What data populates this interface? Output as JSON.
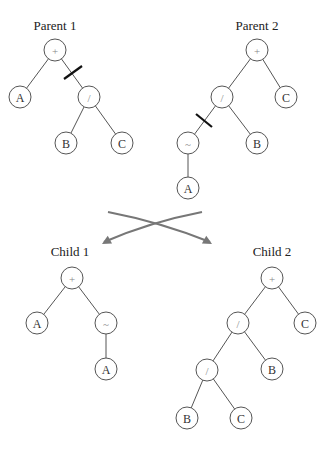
{
  "colors": {
    "edge": "#555555",
    "cut": "#111111",
    "arrow": "#777777"
  },
  "trees": [
    {
      "label": "Parent 1",
      "label_pos": [
        55,
        30
      ],
      "nodes": [
        {
          "id": "p1-plus",
          "text": "+",
          "op": true,
          "x": 55,
          "y": 50
        },
        {
          "id": "p1-a",
          "text": "A",
          "op": false,
          "x": 20,
          "y": 97
        },
        {
          "id": "p1-div",
          "text": "/",
          "op": true,
          "x": 89,
          "y": 97
        },
        {
          "id": "p1-b",
          "text": "B",
          "op": false,
          "x": 66,
          "y": 143
        },
        {
          "id": "p1-c",
          "text": "C",
          "op": false,
          "x": 122,
          "y": 143
        }
      ],
      "edges": [
        [
          "p1-plus",
          "p1-a"
        ],
        [
          "p1-plus",
          "p1-div"
        ],
        [
          "p1-div",
          "p1-b"
        ],
        [
          "p1-div",
          "p1-c"
        ]
      ],
      "cut": {
        "x1": 64,
        "y1": 79,
        "x2": 82,
        "y2": 66
      }
    },
    {
      "label": "Parent 2",
      "label_pos": [
        257,
        30
      ],
      "nodes": [
        {
          "id": "p2-plus",
          "text": "+",
          "op": true,
          "x": 257,
          "y": 50
        },
        {
          "id": "p2-div",
          "text": "/",
          "op": true,
          "x": 222,
          "y": 97
        },
        {
          "id": "p2-c",
          "text": "C",
          "op": false,
          "x": 286,
          "y": 97
        },
        {
          "id": "p2-tilde",
          "text": "~",
          "op": true,
          "x": 188,
          "y": 143
        },
        {
          "id": "p2-b",
          "text": "B",
          "op": false,
          "x": 257,
          "y": 143
        },
        {
          "id": "p2-a",
          "text": "A",
          "op": false,
          "x": 188,
          "y": 188
        }
      ],
      "edges": [
        [
          "p2-plus",
          "p2-div"
        ],
        [
          "p2-plus",
          "p2-c"
        ],
        [
          "p2-div",
          "p2-tilde"
        ],
        [
          "p2-div",
          "p2-b"
        ],
        [
          "p2-tilde",
          "p2-a"
        ]
      ],
      "cut": {
        "x1": 196,
        "y1": 114,
        "x2": 212,
        "y2": 127
      }
    },
    {
      "label": "Child 1",
      "label_pos": [
        70,
        256
      ],
      "nodes": [
        {
          "id": "c1-plus",
          "text": "+",
          "op": true,
          "x": 72,
          "y": 278
        },
        {
          "id": "c1-a",
          "text": "A",
          "op": false,
          "x": 37,
          "y": 323
        },
        {
          "id": "c1-tilde",
          "text": "~",
          "op": true,
          "x": 106,
          "y": 323
        },
        {
          "id": "c1-a2",
          "text": "A",
          "op": false,
          "x": 106,
          "y": 369
        }
      ],
      "edges": [
        [
          "c1-plus",
          "c1-a"
        ],
        [
          "c1-plus",
          "c1-tilde"
        ],
        [
          "c1-tilde",
          "c1-a2"
        ]
      ],
      "cut": null
    },
    {
      "label": "Child 2",
      "label_pos": [
        272,
        256
      ],
      "nodes": [
        {
          "id": "c2-plus",
          "text": "+",
          "op": true,
          "x": 272,
          "y": 278
        },
        {
          "id": "c2-div",
          "text": "/",
          "op": true,
          "x": 238,
          "y": 323
        },
        {
          "id": "c2-c",
          "text": "C",
          "op": false,
          "x": 305,
          "y": 323
        },
        {
          "id": "c2-div2",
          "text": "/",
          "op": true,
          "x": 207,
          "y": 370
        },
        {
          "id": "c2-b",
          "text": "B",
          "op": false,
          "x": 272,
          "y": 369
        },
        {
          "id": "c2-b2",
          "text": "B",
          "op": false,
          "x": 187,
          "y": 418
        },
        {
          "id": "c2-c2",
          "text": "C",
          "op": false,
          "x": 241,
          "y": 418
        }
      ],
      "edges": [
        [
          "c2-plus",
          "c2-div"
        ],
        [
          "c2-plus",
          "c2-c"
        ],
        [
          "c2-div",
          "c2-div2"
        ],
        [
          "c2-div",
          "c2-b"
        ],
        [
          "c2-div2",
          "c2-b2"
        ],
        [
          "c2-div2",
          "c2-c2"
        ]
      ],
      "cut": null
    }
  ],
  "arrows": [
    {
      "name": "arrow-to-child2",
      "path": "M108,212 Q160,222 210,242",
      "tip": [
        212,
        244
      ],
      "dir": [
        1,
        0.55
      ]
    },
    {
      "name": "arrow-to-child1",
      "path": "M202,212 Q150,222 104,242",
      "tip": [
        102,
        244
      ],
      "dir": [
        -1,
        0.55
      ]
    }
  ]
}
